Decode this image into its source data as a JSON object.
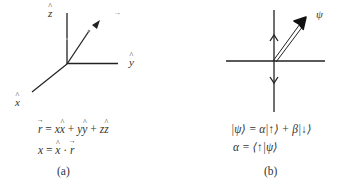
{
  "panel_a": {
    "axis_labels": {
      "z": "z",
      "y": "y",
      "x": "x",
      "vector_marker": "→"
    },
    "equations": {
      "line1": {
        "lhs": "r",
        "rhs_terms": [
          "x",
          "x",
          "y",
          "y",
          "z",
          "z"
        ],
        "text": "r⃗ = x x̂ + y ŷ + z ẑ"
      },
      "line2": {
        "text": "x = x̂ · r⃗"
      }
    },
    "caption": "(a)"
  },
  "panel_b": {
    "vector_label": "ψ",
    "equations": {
      "line1": "|ψ⟩ = α|↑⟩ + β|↓⟩",
      "line2": "α = ⟨↑|ψ⟩"
    },
    "caption": "(b)"
  },
  "colors": {
    "line": "#222222",
    "background": "#ffffff"
  }
}
